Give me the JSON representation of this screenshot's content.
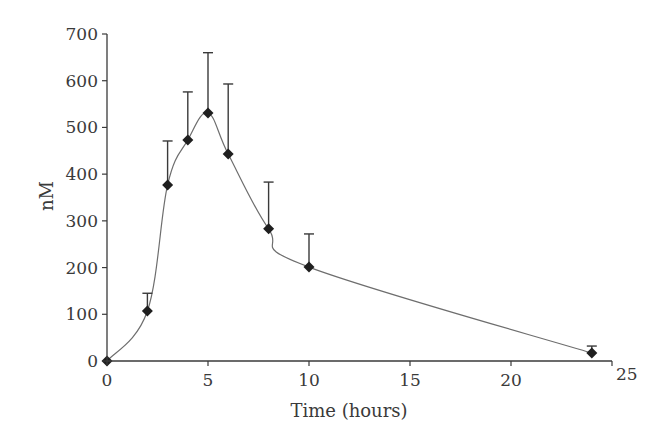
{
  "chart_data": {
    "type": "line",
    "title": "",
    "xlabel": "Time (hours)",
    "ylabel": "nM",
    "xlim": [
      0,
      25
    ],
    "ylim": [
      0,
      700
    ],
    "xticks": [
      0,
      5,
      10,
      15,
      20,
      25
    ],
    "yticks": [
      0,
      100,
      200,
      300,
      400,
      500,
      600,
      700
    ],
    "grid": false,
    "legend": null,
    "series": [
      {
        "name": "Concentration",
        "marker": "diamond",
        "line": "smooth",
        "x": [
          0,
          2,
          3,
          4,
          5,
          6,
          8,
          10,
          24
        ],
        "y": [
          0,
          107,
          377,
          473,
          531,
          443,
          283,
          201,
          17
        ],
        "error_upper": [
          0,
          38,
          94,
          103,
          129,
          150,
          100,
          71,
          15
        ]
      }
    ]
  },
  "colors": {
    "axis": "#3a3a3a",
    "curve": "#6e6e6e",
    "marker": "#1f1f1f",
    "background": "#ffffff"
  }
}
